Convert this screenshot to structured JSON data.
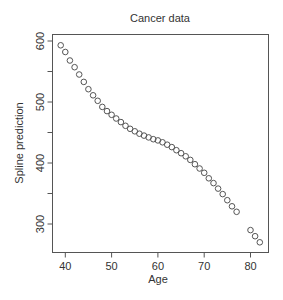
{
  "chart_data": {
    "type": "scatter",
    "title": "Cancer data",
    "xlabel": "Age",
    "ylabel": "Spline prediction",
    "xlim": [
      37.2,
      83.8
    ],
    "ylim": [
      257,
      612
    ],
    "xticks": [
      40,
      50,
      60,
      70,
      80
    ],
    "yticks": [
      300,
      400,
      500,
      600
    ],
    "yminor_ticks": [
      350,
      450,
      550
    ],
    "grid": false,
    "legend": null,
    "marker": "open-circle",
    "series": [
      {
        "name": "Spline prediction",
        "x": [
          39,
          40,
          41,
          42,
          43,
          44,
          45,
          46,
          47,
          48,
          49,
          50,
          51,
          52,
          53,
          54,
          55,
          56,
          57,
          58,
          59,
          60,
          61,
          62,
          63,
          64,
          65,
          66,
          67,
          68,
          69,
          70,
          71,
          72,
          73,
          74,
          75,
          76,
          77,
          80,
          81,
          82
        ],
        "y": [
          593,
          582,
          568,
          557,
          545,
          533,
          521,
          511,
          502,
          492,
          485,
          479,
          473,
          467,
          461,
          456,
          452,
          448,
          445,
          442,
          439,
          437,
          434,
          430,
          426,
          421,
          416,
          411,
          405,
          398,
          391,
          384,
          375,
          367,
          358,
          349,
          339,
          329,
          320,
          290,
          280,
          270
        ]
      }
    ]
  },
  "colors": {
    "stroke": "#555555",
    "text": "#333333",
    "background": "#ffffff"
  }
}
